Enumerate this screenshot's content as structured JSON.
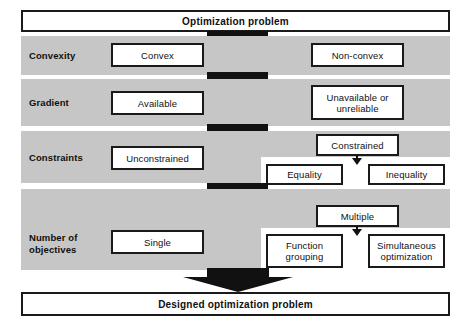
{
  "diagram": {
    "title_box": {
      "label": "Optimization problem"
    },
    "result_box": {
      "label": "Designed optimization problem"
    },
    "rows": [
      {
        "label": "Convexity",
        "left_option": "Convex",
        "right_option": "Non-convex",
        "sub_options": []
      },
      {
        "label": "Gradient",
        "left_option": "Available",
        "right_option": "Unavailable or unreliable",
        "sub_options": []
      },
      {
        "label": "Constraints",
        "left_option": "Unconstrained",
        "right_option": "Constrained",
        "sub_options": [
          "Equality",
          "Inequality"
        ]
      },
      {
        "label": "Number of objectives",
        "left_option": "Single",
        "right_option": "Multiple",
        "sub_options": [
          "Function grouping",
          "Simultaneous optimization"
        ]
      }
    ]
  },
  "colors": {
    "band": "#c6c6c6",
    "box_border": "#1a1a1a",
    "box_fill": "#ffffff",
    "connector": "#111111",
    "page": "#ffffff"
  }
}
